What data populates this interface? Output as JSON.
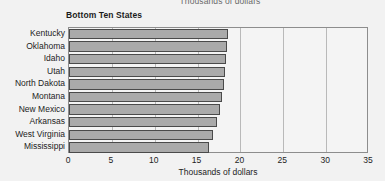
{
  "chart_data": {
    "type": "bar",
    "orientation": "horizontal",
    "title": "Bottom Ten States",
    "subtitle": "Thousands of dollars",
    "xlabel": "Thousands of dollars",
    "ylabel": "",
    "xlim": [
      0,
      35
    ],
    "xticks": [
      0,
      5,
      10,
      15,
      20,
      25,
      30,
      35
    ],
    "xtick_labels": [
      "0",
      "5",
      "10",
      "15",
      "20",
      "25",
      "30",
      "35"
    ],
    "grid": true,
    "grid_axis": "x",
    "legend": false,
    "categories": [
      "Kentucky",
      "Oklahoma",
      "Idaho",
      "Utah",
      "North Dakota",
      "Montana",
      "New Mexico",
      "Arkansas",
      "West Virginia",
      "Mississippi"
    ],
    "values": [
      18.5,
      18.4,
      18.3,
      18.2,
      18.1,
      17.9,
      17.6,
      17.3,
      16.8,
      16.3
    ],
    "bar_color": "#aaaaaa",
    "bar_edge_color": "#4a4a4a",
    "plot_background": "#f4f4f4",
    "page_background": "#f2f2f2",
    "gridline_color": "#b9b9b9"
  }
}
